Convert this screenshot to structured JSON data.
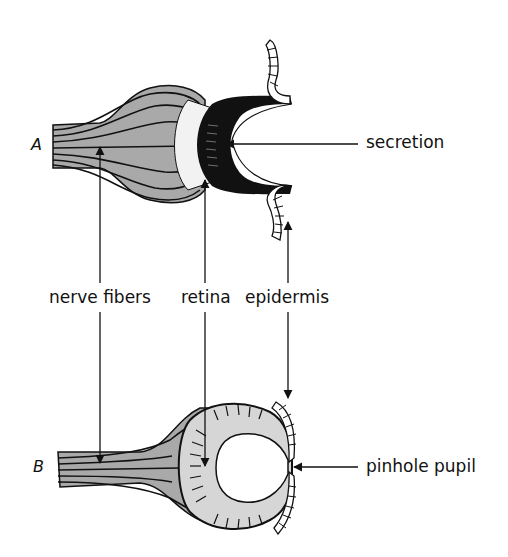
{
  "figure": {
    "parts": [
      {
        "id": "A",
        "label": "A"
      },
      {
        "id": "B",
        "label": "B"
      }
    ],
    "labels": {
      "secretion": "secretion",
      "nerve_fibers": "nerve fibers",
      "retina": "retina",
      "epidermis": "epidermis",
      "pinhole_pupil": "pinhole pupil"
    },
    "colors": {
      "ink": "#111111",
      "nerve_fill": "#a9a9a9",
      "cup_fill": "#d6d6d6",
      "background": "#ffffff"
    }
  }
}
